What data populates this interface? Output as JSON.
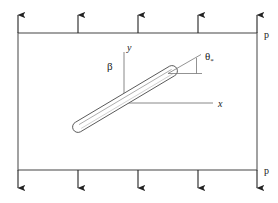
{
  "figure": {
    "background_color": "#ffffff",
    "line_color": "#555555",
    "inclusion_color": "#666666",
    "arrow_color": "#222222",
    "text_color": "#1a1a1a",
    "width": 278,
    "height": 203
  },
  "plate": {
    "name": "rectangular-plate",
    "left": 18,
    "top": 33,
    "right": 257,
    "bottom": 170
  },
  "loads": {
    "top": {
      "label": "p",
      "direction": "up",
      "arrow_count": 5,
      "arrow_x": [
        18,
        78,
        138,
        198,
        257
      ],
      "tail_y": 33,
      "head_y": 13
    },
    "bottom": {
      "label": "p",
      "direction": "down",
      "arrow_count": 5,
      "arrow_x": [
        18,
        78,
        138,
        198,
        257
      ],
      "tail_y": 170,
      "head_y": 190
    }
  },
  "axes": {
    "origin": {
      "x": 124,
      "y": 103
    },
    "y_axis": {
      "label": "y",
      "label_x": 128,
      "label_y": 47,
      "top_y": 52
    },
    "x_axis": {
      "label": "x",
      "label_x": 221,
      "label_y": 104,
      "right_x": 213
    }
  },
  "inclusion": {
    "name": "elliptical-inclusion",
    "tip_lower": {
      "x": 78,
      "y": 127
    },
    "tip_upper": {
      "x": 172,
      "y": 71
    },
    "half_width": 4.5,
    "inclination_deg": 31
  },
  "angles": {
    "beta": {
      "symbol": "β",
      "label_x": 110,
      "label_y": 66,
      "description": "angle between y-axis and inclusion axis"
    },
    "theta": {
      "symbol": "θ",
      "subscript": "*",
      "label_x": 206,
      "label_y": 55,
      "description": "angle between horizontal reference and inclusion axis extension",
      "vertex": {
        "x": 178,
        "y": 73
      },
      "ray_horizontal_end": {
        "x": 201,
        "y": 73
      },
      "ray_inclined_end": {
        "x": 200,
        "y": 57
      }
    }
  }
}
